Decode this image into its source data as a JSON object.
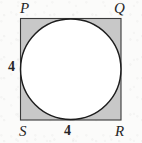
{
  "figure": {
    "kind": "circle-inscribed-in-square",
    "background_color": "#fbfbfa",
    "square": {
      "name": "PQRS",
      "fill_color": "#c8c8c8",
      "stroke_color": "#3a3a3a",
      "stroke_width": 1.1,
      "x": 20.5,
      "y": 18.5,
      "width": 100.5,
      "height": 101.5,
      "side_length_value": "4"
    },
    "circle": {
      "fill_color": "#ffffff",
      "stroke_color": "#1d1d1d",
      "stroke_width": 1.45,
      "center_x": 70.75,
      "center_y": 69.25,
      "radius": 50.2,
      "inscribed": true
    },
    "vertex_labels": [
      {
        "id": "P",
        "text": "P",
        "position": "top-left"
      },
      {
        "id": "Q",
        "text": "Q",
        "position": "top-right"
      },
      {
        "id": "S",
        "text": "S",
        "position": "bottom-left"
      },
      {
        "id": "R",
        "text": "R",
        "position": "bottom-right"
      }
    ],
    "length_labels": [
      {
        "id": "left-side",
        "text": "4",
        "edge": "PS",
        "position": "left-middle"
      },
      {
        "id": "bottom-side",
        "text": "4",
        "edge": "SR",
        "position": "bottom-center"
      }
    ]
  }
}
